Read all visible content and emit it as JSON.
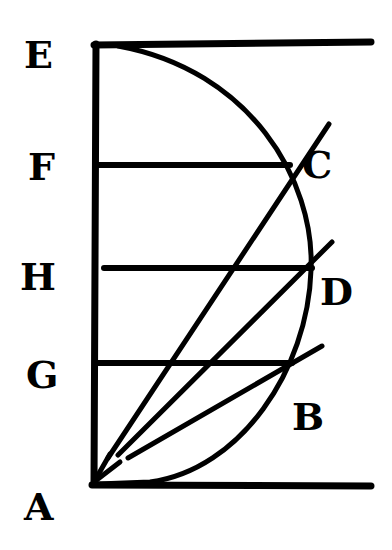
{
  "diagram": {
    "type": "geometric-figure",
    "background": "#ffffff",
    "ink": "#000000",
    "labels": {
      "E": "E",
      "F": "F",
      "H": "H",
      "G": "G",
      "A": "A",
      "C": "C",
      "D": "D",
      "B": "B"
    },
    "points": {
      "E": [
        96,
        46
      ],
      "A": [
        93,
        484
      ],
      "F": [
        96,
        165
      ],
      "H": [
        96,
        268
      ],
      "G": [
        96,
        363
      ],
      "C": [
        288,
        165
      ],
      "D": [
        311,
        268
      ],
      "B": [
        290,
        363
      ]
    },
    "elements": [
      {
        "name": "vertical-axis-EA",
        "from": "E",
        "to": "A"
      },
      {
        "name": "top-horizontal-line",
        "from": "E",
        "to_x": 372
      },
      {
        "name": "bottom-horizontal-line",
        "from": "A",
        "to_x": 372
      },
      {
        "name": "semicircle-arc",
        "from": "E",
        "to": "A",
        "bulge": "right"
      },
      {
        "name": "chord-F",
        "from": "F",
        "to": "C"
      },
      {
        "name": "chord-H",
        "from": "H",
        "to": "D"
      },
      {
        "name": "chord-G",
        "from": "G",
        "to": "B"
      },
      {
        "name": "ray-AC",
        "from": "A",
        "through": "C"
      },
      {
        "name": "ray-AD",
        "from": "A",
        "through": "D"
      },
      {
        "name": "ray-AB",
        "from": "A",
        "through": "B"
      }
    ]
  }
}
